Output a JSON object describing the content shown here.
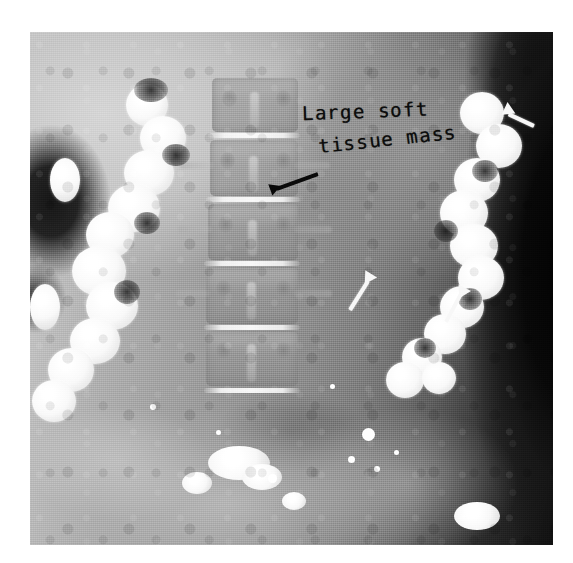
{
  "image": {
    "modality": "radiograph",
    "description": "Plain abdominal radiograph with barium-filled colon showing a large soft tissue mass",
    "border_color": "#ffffff",
    "plate": {
      "x": 30,
      "y": 32,
      "width": 523,
      "height": 513
    }
  },
  "annotations": {
    "label": {
      "name": "soft-tissue-mass-label",
      "line_1": "Large soft",
      "line_2": "tissue mass",
      "color": "#0c0c0c"
    },
    "arrows": [
      {
        "name": "arrow-mass-upper-right",
        "color": "#f7f7f7",
        "tip_x": 504,
        "tip_y": 112,
        "angle_deg": 205,
        "length": 30,
        "style": "white"
      },
      {
        "name": "arrow-spine-displacement",
        "color": "#0a0a0a",
        "tip_x": 258,
        "tip_y": 196,
        "angle_deg": 28,
        "length": 40,
        "style": "black"
      },
      {
        "name": "arrow-mass-midline",
        "color": "#f7f7f7",
        "tip_x": 357,
        "tip_y": 272,
        "angle_deg": 215,
        "length": 34,
        "style": "white"
      },
      {
        "name": "arrow-mass-lower-right",
        "color": "#f7f7f7",
        "tip_x": 472,
        "tip_y": 282,
        "angle_deg": 215,
        "length": 32,
        "style": "white"
      }
    ]
  },
  "anatomy": {
    "spine": {
      "name": "lumbar-spine",
      "vertebrae_count": 5,
      "vertebrae": [
        {
          "label": "L1",
          "x": 182,
          "y": 46,
          "w": 86,
          "h": 54
        },
        {
          "label": "L2",
          "x": 180,
          "y": 108,
          "w": 88,
          "h": 56
        },
        {
          "label": "L3",
          "x": 178,
          "y": 172,
          "w": 90,
          "h": 56
        },
        {
          "label": "L4",
          "x": 176,
          "y": 236,
          "w": 92,
          "h": 56
        },
        {
          "label": "L5",
          "x": 176,
          "y": 300,
          "w": 92,
          "h": 54
        }
      ],
      "disc_spaces": [
        {
          "x": 178,
          "y": 101,
          "w": 92
        },
        {
          "x": 176,
          "y": 165,
          "w": 94
        },
        {
          "x": 174,
          "y": 229,
          "w": 96
        },
        {
          "x": 174,
          "y": 293,
          "w": 96
        },
        {
          "x": 174,
          "y": 356,
          "w": 96
        }
      ]
    },
    "colon_left": {
      "name": "ascending-colon-barium",
      "haustra": [
        {
          "x": 96,
          "y": 52,
          "d": 42
        },
        {
          "x": 110,
          "y": 84,
          "d": 46
        },
        {
          "x": 94,
          "y": 118,
          "d": 50
        },
        {
          "x": 78,
          "y": 152,
          "d": 52
        },
        {
          "x": 56,
          "y": 180,
          "d": 48
        },
        {
          "x": 42,
          "y": 214,
          "d": 54
        },
        {
          "x": 56,
          "y": 250,
          "d": 52
        },
        {
          "x": 40,
          "y": 286,
          "d": 50
        },
        {
          "x": 18,
          "y": 316,
          "d": 46
        },
        {
          "x": 6,
          "y": 350,
          "d": 44
        }
      ]
    },
    "colon_right": {
      "name": "descending-colon-barium",
      "haustra": [
        {
          "x": 430,
          "y": 64,
          "d": 44
        },
        {
          "x": 444,
          "y": 98,
          "d": 46
        },
        {
          "x": 424,
          "y": 130,
          "d": 46
        },
        {
          "x": 410,
          "y": 162,
          "d": 48
        },
        {
          "x": 418,
          "y": 196,
          "d": 48
        },
        {
          "x": 428,
          "y": 228,
          "d": 46
        },
        {
          "x": 412,
          "y": 258,
          "d": 44
        },
        {
          "x": 396,
          "y": 286,
          "d": 42
        },
        {
          "x": 372,
          "y": 310,
          "d": 40
        },
        {
          "x": 358,
          "y": 336,
          "d": 38
        }
      ]
    },
    "pelvis_barium": [
      {
        "x": 178,
        "y": 414,
        "w": 62,
        "h": 34
      },
      {
        "x": 212,
        "y": 432,
        "w": 40,
        "h": 26
      },
      {
        "x": 152,
        "y": 440,
        "w": 30,
        "h": 22
      },
      {
        "x": 424,
        "y": 470,
        "w": 46,
        "h": 28
      },
      {
        "x": 252,
        "y": 460,
        "w": 24,
        "h": 18
      }
    ],
    "specks": [
      {
        "x": 332,
        "y": 396,
        "d": 13
      },
      {
        "x": 318,
        "y": 424,
        "d": 7
      },
      {
        "x": 344,
        "y": 434,
        "d": 6
      },
      {
        "x": 364,
        "y": 418,
        "d": 5
      },
      {
        "x": 238,
        "y": 442,
        "d": 9
      },
      {
        "x": 120,
        "y": 372,
        "d": 6
      },
      {
        "x": 300,
        "y": 352,
        "d": 5
      },
      {
        "x": 186,
        "y": 398,
        "d": 5
      }
    ]
  }
}
